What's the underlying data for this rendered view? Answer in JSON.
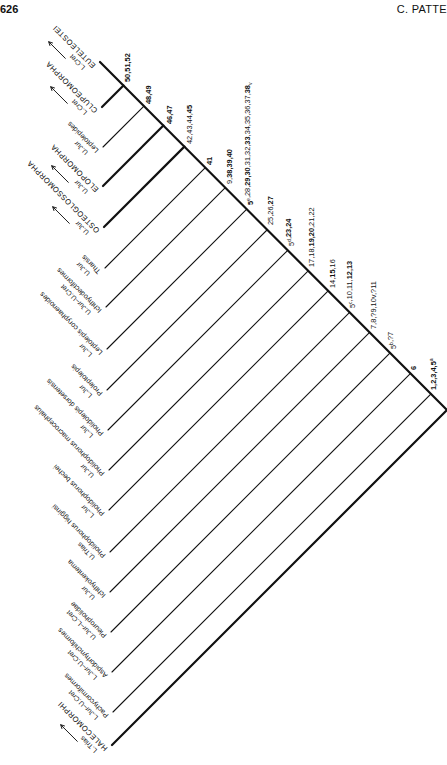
{
  "header": {
    "page_number": "626",
    "running_head": "C. PATTE"
  },
  "diagram": {
    "type": "cladogram",
    "stem": {
      "x1": 100,
      "y1": 62,
      "x2": 447,
      "y2": 410
    },
    "terminals": [
      {
        "name": "EUTELEOSTEI",
        "age": "L.Cret",
        "major": true,
        "arrow": true,
        "tip": [
          100,
          62
        ],
        "thick": true
      },
      {
        "name": "CLUPEOMORPHA",
        "age": "L.Cret",
        "major": true,
        "arrow": true,
        "tip": [
          102,
          107
        ],
        "thick": true
      },
      {
        "name": "Leptolepides",
        "age": "U.Jur",
        "major": false,
        "arrow": false,
        "tip": [
          103,
          147
        ],
        "thick": false
      },
      {
        "name": "ELOPOMORPHA",
        "age": "U.Jur",
        "major": true,
        "arrow": true,
        "tip": [
          103,
          186
        ],
        "thick": true
      },
      {
        "name": "OSTEOGLOSSOMORPHA",
        "age": "U.Jur",
        "major": true,
        "arrow": true,
        "tip": [
          104,
          227
        ],
        "thick": true
      },
      {
        "name": "Tharsis",
        "age": "U.Jur",
        "major": false,
        "arrow": false,
        "tip": [
          105,
          268
        ],
        "thick": false
      },
      {
        "name": "Ichthyodectiformes",
        "age": "U.Jur–U.Cret",
        "major": false,
        "arrow": false,
        "tip": [
          106,
          307
        ],
        "thick": false
      },
      {
        "name": "Leptolepis coryphaenoides",
        "age": "L.Jur",
        "major": false,
        "arrow": false,
        "tip": [
          107,
          349
        ],
        "thick": false
      },
      {
        "name": "Proleptolepis",
        "age": "L.Jur",
        "major": false,
        "arrow": false,
        "tip": [
          107,
          390
        ],
        "thick": false
      },
      {
        "name": "Pholidolepis dorsetensis",
        "age": "L.Jur",
        "major": false,
        "arrow": false,
        "tip": [
          108,
          430
        ],
        "thick": false
      },
      {
        "name": "Pholidophorus macrocephalus",
        "age": "U.Jur",
        "major": false,
        "arrow": false,
        "tip": [
          109,
          470
        ],
        "thick": false
      },
      {
        "name": "Pholidophorus bechei",
        "age": "L.Jur",
        "major": false,
        "arrow": false,
        "tip": [
          109,
          510
        ],
        "thick": false
      },
      {
        "name": "Pholidophorus higginsi",
        "age": "U.Trias",
        "major": false,
        "arrow": false,
        "tip": [
          110,
          552
        ],
        "thick": false
      },
      {
        "name": "Ichthyokentema",
        "age": "U.Jur",
        "major": false,
        "arrow": false,
        "tip": [
          110,
          592
        ],
        "thick": false
      },
      {
        "name": "Pleuropholidae",
        "age": "U.Jur–L.Cret",
        "major": false,
        "arrow": false,
        "tip": [
          111,
          632
        ],
        "thick": false
      },
      {
        "name": "Aspidorhynchiformes",
        "age": "L.Jur–U.Cret",
        "major": false,
        "arrow": false,
        "tip": [
          112,
          672
        ],
        "thick": false
      },
      {
        "name": "Pachycormiformes",
        "age": "L.Jur–U.Cret",
        "major": false,
        "arrow": false,
        "tip": [
          113,
          712
        ],
        "thick": false
      },
      {
        "name": "HALECOMORPHI",
        "age": "L.Trias",
        "major": true,
        "arrow": true,
        "tip": [
          112,
          745
        ],
        "thick": true
      }
    ],
    "node_labels": [
      {
        "parts": [
          [
            "50,51,52",
            "b"
          ]
        ],
        "at": [
          124,
          84
        ]
      },
      {
        "parts": [
          [
            "48,49",
            "b"
          ]
        ],
        "at": [
          145,
          106
        ]
      },
      {
        "parts": [
          [
            "46,47",
            "b"
          ]
        ],
        "at": [
          166,
          126
        ]
      },
      {
        "parts": [
          [
            "42,43,44,",
            "n"
          ],
          [
            "45",
            "b"
          ]
        ],
        "at": [
          186,
          146
        ]
      },
      {
        "parts": [
          [
            "41",
            "b"
          ]
        ],
        "at": [
          206,
          167
        ]
      },
      {
        "parts": [
          [
            "9,",
            "n"
          ],
          [
            "38,39,40",
            "b"
          ]
        ],
        "at": [
          226,
          186
        ]
      },
      {
        "parts": [
          [
            "5",
            "b"
          ],
          [
            "e",
            "sup"
          ],
          [
            ",28,",
            "n"
          ],
          [
            "29,30",
            "b"
          ],
          [
            ",31,32,",
            "n"
          ],
          [
            "33",
            "b"
          ],
          [
            ",34,35,36,37,",
            "n"
          ],
          [
            "38",
            "b"
          ],
          [
            "v",
            "sub"
          ]
        ],
        "at": [
          247,
          207
        ]
      },
      {
        "parts": [
          [
            "25,26,",
            "n"
          ],
          [
            "27",
            "b"
          ]
        ],
        "at": [
          267,
          227
        ]
      },
      {
        "parts": [
          [
            "5",
            "n"
          ],
          [
            "d",
            "sup"
          ],
          [
            ",",
            "n"
          ],
          [
            "23,24",
            "b"
          ]
        ],
        "at": [
          288,
          248
        ]
      },
      {
        "parts": [
          [
            "17,18,",
            "n"
          ],
          [
            "19,20",
            "b"
          ],
          [
            ",21,22",
            "n"
          ]
        ],
        "at": [
          308,
          269
        ]
      },
      {
        "parts": [
          [
            "14,",
            "n"
          ],
          [
            "15",
            "b"
          ],
          [
            ",16",
            "n"
          ]
        ],
        "at": [
          329,
          290
        ]
      },
      {
        "parts": [
          [
            "5",
            "n"
          ],
          [
            "c",
            "sup"
          ],
          [
            ",10,11,",
            "n"
          ],
          [
            "12,13",
            "b"
          ]
        ],
        "at": [
          349,
          310
        ]
      },
      {
        "parts": [
          [
            "7,8,?9,10v,?11",
            "n"
          ]
        ],
        "at": [
          370,
          331
        ]
      },
      {
        "parts": [
          [
            "5",
            "n"
          ],
          [
            "b",
            "sup"
          ],
          [
            ",?7",
            "n"
          ]
        ],
        "at": [
          390,
          351
        ]
      },
      {
        "parts": [
          [
            "6",
            "b"
          ]
        ],
        "at": [
          410,
          372
        ]
      },
      {
        "parts": [
          [
            "1,2,3,4,5",
            "b"
          ],
          [
            "a",
            "sup"
          ]
        ],
        "at": [
          430,
          392
        ]
      }
    ],
    "colors": {
      "ink": "#111111",
      "background": "#ffffff"
    }
  }
}
